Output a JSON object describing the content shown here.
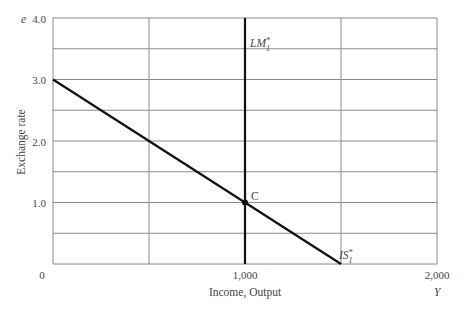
{
  "chart_data": {
    "type": "line",
    "title": "",
    "xlabel": "Income, Output",
    "xaxis_symbol": "Y",
    "ylabel": "Exchange rate",
    "yaxis_symbol": "e",
    "xlim": [
      0,
      2000
    ],
    "ylim": [
      0,
      4.0
    ],
    "x_ticks": [
      "0",
      "1,000",
      "2,000"
    ],
    "y_ticks": [
      "1.0",
      "2.0",
      "3.0",
      "4.0"
    ],
    "grid": true,
    "grid_x_step": 500,
    "grid_y_step": 0.5,
    "series": [
      {
        "name": "IS*1",
        "label_main": "IS",
        "label_sup": "*",
        "label_sub": "1",
        "points": [
          [
            0,
            3.0
          ],
          [
            1500,
            0.0
          ]
        ]
      },
      {
        "name": "LM*1",
        "label_main": "LM",
        "label_sup": "*",
        "label_sub": "1",
        "points": [
          [
            1000,
            0.0
          ],
          [
            1000,
            4.0
          ]
        ]
      }
    ],
    "annotations": [
      {
        "text": "C",
        "x": 1000,
        "y": 1.0,
        "marker": "dot"
      }
    ]
  }
}
